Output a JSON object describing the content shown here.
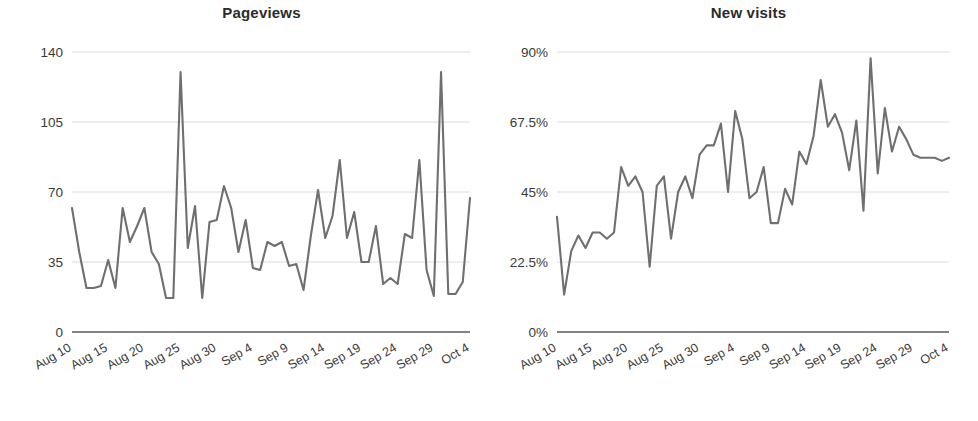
{
  "page": {
    "background": "#ffffff",
    "line_color": "#6f6f6f",
    "grid_color": "#d8dce0",
    "axis_color": "#5a5a5a",
    "text_color": "#3a3a3a"
  },
  "charts": [
    {
      "id": "pageviews",
      "title": "Pageviews",
      "y_ticks": [
        "140",
        "105",
        "70",
        "35",
        "0"
      ],
      "x_ticks": [
        "Aug 10",
        "Aug 15",
        "Aug 20",
        "Aug 25",
        "Aug 30",
        "Sep 4",
        "Sep 9",
        "Sep 14",
        "Sep 19",
        "Sep 24",
        "Sep 29",
        "Oct 4"
      ]
    },
    {
      "id": "new-visits",
      "title": "New visits",
      "y_ticks": [
        "90%",
        "67.5%",
        "45%",
        "22.5%",
        "0%"
      ],
      "x_ticks": [
        "Aug 10",
        "Aug 15",
        "Aug 20",
        "Aug 25",
        "Aug 30",
        "Sep 4",
        "Sep 9",
        "Sep 14",
        "Sep 19",
        "Sep 24",
        "Sep 29",
        "Oct 4"
      ]
    }
  ],
  "chart_data": [
    {
      "type": "line",
      "title": "Pageviews",
      "xlabel": "",
      "ylabel": "",
      "ylim": [
        0,
        140
      ],
      "yticks": [
        0,
        35,
        70,
        105,
        140
      ],
      "ytick_labels": [
        "0",
        "35",
        "70",
        "105",
        "140"
      ],
      "grid": true,
      "legend": "none",
      "x": [
        "Aug 10",
        "Aug 11",
        "Aug 12",
        "Aug 13",
        "Aug 14",
        "Aug 15",
        "Aug 16",
        "Aug 17",
        "Aug 18",
        "Aug 19",
        "Aug 20",
        "Aug 21",
        "Aug 22",
        "Aug 23",
        "Aug 24",
        "Aug 25",
        "Aug 26",
        "Aug 27",
        "Aug 28",
        "Aug 29",
        "Aug 30",
        "Aug 31",
        "Sep 1",
        "Sep 2",
        "Sep 3",
        "Sep 4",
        "Sep 5",
        "Sep 6",
        "Sep 7",
        "Sep 8",
        "Sep 9",
        "Sep 10",
        "Sep 11",
        "Sep 12",
        "Sep 13",
        "Sep 14",
        "Sep 15",
        "Sep 16",
        "Sep 17",
        "Sep 18",
        "Sep 19",
        "Sep 20",
        "Sep 21",
        "Sep 22",
        "Sep 23",
        "Sep 24",
        "Sep 25",
        "Sep 26",
        "Sep 27",
        "Sep 28",
        "Sep 29",
        "Sep 30",
        "Oct 1",
        "Oct 2",
        "Oct 3",
        "Oct 4"
      ],
      "xtick_labels": [
        "Aug 10",
        "Aug 15",
        "Aug 20",
        "Aug 25",
        "Aug 30",
        "Sep 4",
        "Sep 9",
        "Sep 14",
        "Sep 19",
        "Sep 24",
        "Sep 29",
        "Oct 4"
      ],
      "xtick_every": 5,
      "series": [
        {
          "name": "Pageviews",
          "color": "#6f6f6f",
          "values": [
            62,
            40,
            22,
            22,
            23,
            36,
            22,
            62,
            45,
            53,
            62,
            40,
            34,
            17,
            17,
            130,
            42,
            63,
            17,
            55,
            56,
            73,
            62,
            40,
            56,
            32,
            31,
            45,
            43,
            45,
            33,
            34,
            21,
            48,
            71,
            47,
            58,
            86,
            47,
            60,
            35,
            35,
            53,
            24,
            27,
            24,
            49,
            47,
            86,
            31,
            18,
            130,
            19,
            19,
            25,
            67
          ]
        }
      ]
    },
    {
      "type": "line",
      "title": "New visits",
      "xlabel": "",
      "ylabel": "",
      "ylim": [
        0,
        90
      ],
      "yticks": [
        0,
        22.5,
        45,
        67.5,
        90
      ],
      "ytick_labels": [
        "0%",
        "22.5%",
        "45%",
        "67.5%",
        "90%"
      ],
      "grid": true,
      "legend": "none",
      "unit": "%",
      "x": [
        "Aug 10",
        "Aug 11",
        "Aug 12",
        "Aug 13",
        "Aug 14",
        "Aug 15",
        "Aug 16",
        "Aug 17",
        "Aug 18",
        "Aug 19",
        "Aug 20",
        "Aug 21",
        "Aug 22",
        "Aug 23",
        "Aug 24",
        "Aug 25",
        "Aug 26",
        "Aug 27",
        "Aug 28",
        "Aug 29",
        "Aug 30",
        "Aug 31",
        "Sep 1",
        "Sep 2",
        "Sep 3",
        "Sep 4",
        "Sep 5",
        "Sep 6",
        "Sep 7",
        "Sep 8",
        "Sep 9",
        "Sep 10",
        "Sep 11",
        "Sep 12",
        "Sep 13",
        "Sep 14",
        "Sep 15",
        "Sep 16",
        "Sep 17",
        "Sep 18",
        "Sep 19",
        "Sep 20",
        "Sep 21",
        "Sep 22",
        "Sep 23",
        "Sep 24",
        "Sep 25",
        "Sep 26",
        "Sep 27",
        "Sep 28",
        "Sep 29",
        "Sep 30",
        "Oct 1",
        "Oct 2",
        "Oct 3",
        "Oct 4"
      ],
      "xtick_labels": [
        "Aug 10",
        "Aug 15",
        "Aug 20",
        "Aug 25",
        "Aug 30",
        "Sep 4",
        "Sep 9",
        "Sep 14",
        "Sep 19",
        "Sep 24",
        "Sep 29",
        "Oct 4"
      ],
      "xtick_every": 5,
      "series": [
        {
          "name": "New visits",
          "color": "#6f6f6f",
          "values": [
            37,
            12,
            26,
            31,
            27,
            32,
            32,
            30,
            32,
            53,
            47,
            50,
            45,
            21,
            47,
            50,
            30,
            45,
            50,
            43,
            57,
            60,
            60,
            67,
            45,
            71,
            62,
            43,
            45,
            53,
            35,
            35,
            46,
            41,
            58,
            54,
            63,
            81,
            66,
            70,
            64,
            52,
            68,
            39,
            88,
            51,
            72,
            58,
            66,
            62,
            57,
            56,
            56,
            56,
            55,
            56
          ]
        }
      ]
    }
  ]
}
